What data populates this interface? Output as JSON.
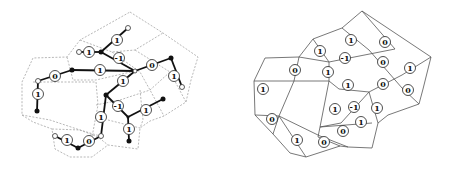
{
  "figure": {
    "panels": [
      {
        "name": "left-panel",
        "description": "Dual graph tree with edge weights over dashed primal graph",
        "labels": [
          "1",
          "1",
          "-1",
          "1",
          "0",
          "0",
          "1",
          "1",
          "1",
          "-1",
          "1",
          "1",
          "1",
          "1",
          "0"
        ]
      },
      {
        "name": "right-panel",
        "description": "Planar directed graph with edge weights",
        "labels": [
          "1",
          "0",
          "1",
          "-1",
          "0",
          "0",
          "1",
          "1",
          "1",
          "0",
          "1",
          "0",
          "1",
          "-1",
          "1",
          "1",
          "0",
          "0",
          "1",
          "0"
        ]
      }
    ]
  }
}
